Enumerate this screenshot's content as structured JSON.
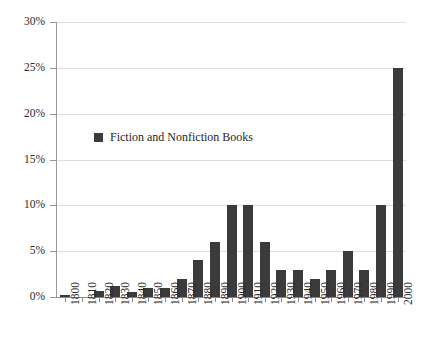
{
  "chart_data": {
    "type": "bar",
    "title": "",
    "subtitle": "",
    "xlabel": "",
    "ylabel": "",
    "categories": [
      "1800",
      "1810",
      "1820",
      "1830",
      "1840",
      "1850",
      "1860",
      "1870",
      "1880",
      "1890",
      "1900",
      "1910",
      "1920",
      "1930",
      "1940",
      "1950",
      "1960",
      "1970",
      "1980",
      "1990",
      "2000"
    ],
    "series": [
      {
        "name": "Fiction and Nonfiction Books",
        "color": "#3b3b3b",
        "values": [
          0.2,
          0,
          0.7,
          1.2,
          0.6,
          1,
          1,
          2,
          4,
          6,
          10,
          10,
          6,
          3,
          3,
          2,
          3,
          5,
          3,
          10,
          25
        ]
      }
    ],
    "ylim": [
      0,
      30
    ],
    "ytick_values": [
      0,
      5,
      10,
      15,
      20,
      25,
      30
    ],
    "ytick_labels": [
      "0%",
      "5%",
      "10%",
      "15%",
      "20%",
      "25%",
      "30%"
    ],
    "value_suffix": "%",
    "grid": true,
    "grid_axis": "y",
    "grid_color": "#dedede",
    "legend_position": "inside-upper-left",
    "axis_color": "#8a8a8a",
    "background": "#ffffff"
  },
  "legend": {
    "entries": [
      {
        "label": "Fiction and Nonfiction Books",
        "color": "#3b3b3b"
      }
    ]
  }
}
